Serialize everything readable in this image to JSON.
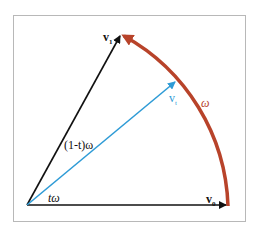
{
  "diagram": {
    "colors": {
      "frame": "#b8b8b8",
      "vectors": "#111111",
      "interpolated": "#2e9bd6",
      "arc": "#b8432a"
    },
    "labels": {
      "v1": "v",
      "v1_sub": "1",
      "v0": "v",
      "v0_sub": "0",
      "vt": "v",
      "vt_sub": "t",
      "omega": "ω",
      "one_minus_t_omega": "(1-t)ω",
      "t_omega": "tω"
    }
  }
}
